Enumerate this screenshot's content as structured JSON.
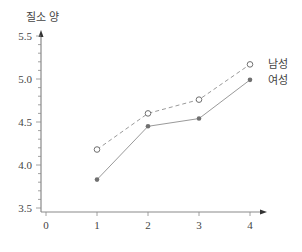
{
  "chart_data": {
    "type": "line",
    "title": "",
    "ylabel": "질소 양",
    "xlabel": "",
    "x": [
      1,
      2,
      3,
      4
    ],
    "xticks": [
      "0",
      "1",
      "2",
      "3",
      "4"
    ],
    "yticks": [
      "3.5",
      "4.0",
      "4.5",
      "5.0",
      "5.5"
    ],
    "ylim": [
      3.5,
      5.5
    ],
    "xlim": [
      0,
      4
    ],
    "grid": false,
    "legend_position": "right, inline at line ends",
    "series": [
      {
        "name": "남성",
        "values": [
          4.18,
          4.6,
          4.76,
          5.17
        ],
        "style": "dashed",
        "marker": "open-circle",
        "color": "#8a8a8a"
      },
      {
        "name": "여성",
        "values": [
          3.83,
          4.45,
          4.54,
          4.99
        ],
        "style": "solid",
        "marker": "filled-circle",
        "color": "#8a8a8a"
      }
    ]
  },
  "colors": {
    "axis": "#8a8a8a",
    "line": "#9a9a9a",
    "marker": "#707070",
    "text": "#444444"
  }
}
